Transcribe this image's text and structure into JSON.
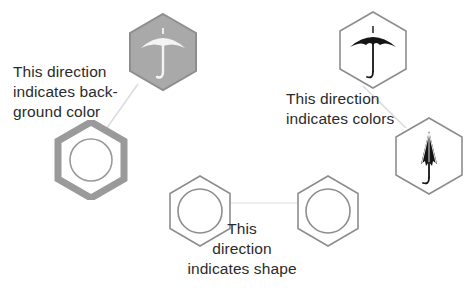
{
  "figure": {
    "background_color": "#ffffff",
    "width": 473,
    "height": 293
  },
  "captions": [
    {
      "id": "background-color",
      "text": "This direction\nindicates back-\nground color",
      "color": "#2b2b2b"
    },
    {
      "id": "colors",
      "text": "This direction\nindicates colors",
      "color": "#2b2b2b"
    },
    {
      "id": "shape",
      "text": "This\ndirection\nindicates shape",
      "color": "#2b2b2b"
    }
  ],
  "glyphs": [
    {
      "id": "hex-gray-fill-white-umbrella",
      "label": "hexagon with gray background and white open umbrella",
      "hex_fill": "#a9a9a9",
      "hex_stroke": "#8e8e8e",
      "icon": "open-umbrella",
      "icon_color": "#f2f2f2",
      "x": 126,
      "y": 12,
      "size": 74
    },
    {
      "id": "hex-white-fill-gray-ring",
      "label": "hexagon with white background and gray ring",
      "hex_fill": "#ffffff",
      "hex_stroke": "#9a9a9a",
      "icon": "circle-outline",
      "icon_color": "#9a9a9a",
      "x": 54,
      "y": 120,
      "size": 74
    },
    {
      "id": "hex-white-fill-black-umbrella",
      "label": "hexagon with white background and black open umbrella",
      "hex_fill": "#ffffff",
      "hex_stroke": "#8d8d8d",
      "icon": "open-umbrella",
      "icon_color": "#1a1a1a",
      "x": 336,
      "y": 10,
      "size": 74
    },
    {
      "id": "hex-white-fill-closed-umbrella",
      "label": "hexagon with white background and black closed umbrella",
      "hex_fill": "#ffffff",
      "hex_stroke": "#8d8d8d",
      "icon": "closed-umbrella",
      "icon_color": "#1a1a1a",
      "x": 392,
      "y": 116,
      "size": 74
    },
    {
      "id": "hex-bottom-left-circle",
      "label": "hexagon with white background and thin gray circle",
      "hex_fill": "#ffffff",
      "hex_stroke": "#8d8d8d",
      "icon": "circle-outline-thin",
      "icon_color": "#8d8d8d",
      "x": 166,
      "y": 174,
      "size": 68
    },
    {
      "id": "hex-bottom-right-circle",
      "label": "hexagon with white background and thin gray circle",
      "hex_fill": "#ffffff",
      "hex_stroke": "#8d8d8d",
      "icon": "circle-outline-thin",
      "icon_color": "#8d8d8d",
      "x": 294,
      "y": 174,
      "size": 68
    }
  ],
  "connectors": [
    {
      "id": "connector-background-color",
      "from": "hex-gray-fill-white-umbrella",
      "to": "hex-white-fill-gray-ring",
      "color": "#dcdcdc"
    },
    {
      "id": "connector-colors",
      "from": "hex-white-fill-black-umbrella",
      "to": "hex-white-fill-closed-umbrella",
      "color": "#dcdcdc"
    },
    {
      "id": "connector-shape",
      "from": "hex-bottom-left-circle",
      "to": "hex-bottom-right-circle",
      "color": "#e4e4e4"
    }
  ]
}
